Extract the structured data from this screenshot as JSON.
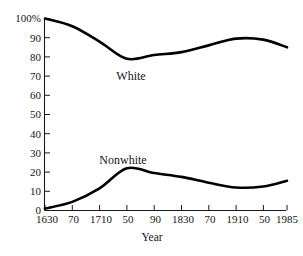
{
  "chart_data": {
    "type": "line",
    "title": "",
    "xlabel": "Year",
    "ylabel": "",
    "grid": false,
    "legend_position": "inline-annotation",
    "xlim": [
      1630,
      1985
    ],
    "ylim": [
      0,
      100
    ],
    "y_ticks": [
      0,
      10,
      20,
      30,
      40,
      50,
      60,
      70,
      80,
      90,
      100
    ],
    "y_tick_labels": [
      "0",
      "10",
      "20",
      "30",
      "40",
      "50",
      "60",
      "70",
      "80",
      "90",
      "100%"
    ],
    "x_ticks": [
      1630,
      1670,
      1710,
      1750,
      1790,
      1830,
      1870,
      1910,
      1950,
      1985
    ],
    "x_tick_labels": [
      "1630",
      "70",
      "1710",
      "50",
      "90",
      "1830",
      "70",
      "1910",
      "50",
      "1985"
    ],
    "x": [
      1630,
      1670,
      1710,
      1750,
      1790,
      1830,
      1870,
      1910,
      1950,
      1985
    ],
    "series": [
      {
        "name": "White",
        "label": "White",
        "color": "#000000",
        "values": [
          100,
          96,
          88,
          79,
          81,
          82.5,
          86,
          89.5,
          89,
          85
        ]
      },
      {
        "name": "Nonwhite",
        "label": "Nonwhite",
        "color": "#000000",
        "values": [
          1,
          4.5,
          11.5,
          22,
          19.5,
          17.5,
          14.5,
          12,
          12.5,
          15.5
        ]
      }
    ],
    "annotations": [
      {
        "text": "White",
        "x": 1745,
        "y": 71
      },
      {
        "text": "Nonwhite",
        "x": 1735,
        "y": 31
      }
    ]
  }
}
